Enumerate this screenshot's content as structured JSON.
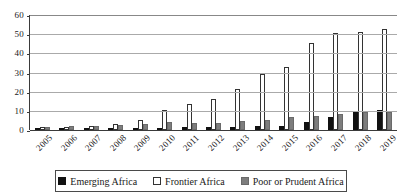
{
  "chart_data": {
    "type": "bar",
    "title": "",
    "subtitle": "",
    "xlabel": "",
    "ylabel": "",
    "ylim": [
      0,
      60
    ],
    "yticks": [
      0,
      10,
      20,
      30,
      40,
      50,
      60
    ],
    "grid": true,
    "legend_position": "bottom",
    "categories": [
      "2005",
      "2006",
      "2007",
      "2008",
      "2009",
      "2010",
      "2011",
      "2012",
      "2013",
      "2014",
      "2015",
      "2016",
      "2017",
      "2018",
      "2019"
    ],
    "series": [
      {
        "name": "Emerging Africa",
        "color": "#111111",
        "values": [
          0.6,
          0.5,
          0.8,
          0.9,
          0.8,
          1.0,
          1.4,
          1.6,
          1.6,
          2.1,
          2.1,
          4.2,
          6.8,
          10.1,
          10.2
        ]
      },
      {
        "name": "Frontier Africa",
        "color": "#ffffff",
        "values": [
          1.5,
          1.6,
          1.9,
          2.9,
          5.2,
          10.3,
          13.6,
          16.0,
          21.5,
          29.4,
          32.8,
          45.5,
          50.5,
          51.3,
          52.9
        ]
      },
      {
        "name": "Poor or Prudent Africa",
        "color": "#7d7d7d",
        "values": [
          1.8,
          1.9,
          1.9,
          2.4,
          3.3,
          4.0,
          3.9,
          3.8,
          4.8,
          5.3,
          6.6,
          7.5,
          8.6,
          9.4,
          9.3
        ]
      }
    ]
  },
  "legend": {
    "items": [
      {
        "label": "Emerging Africa",
        "swatch": "filled-black-square-icon"
      },
      {
        "label": "Frontier Africa",
        "swatch": "outlined-white-square-icon"
      },
      {
        "label": "Poor or Prudent Africa",
        "swatch": "filled-gray-square-icon"
      }
    ]
  }
}
